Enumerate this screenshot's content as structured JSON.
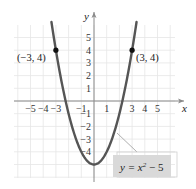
{
  "chart_data": {
    "type": "line",
    "title": "",
    "xlabel": "x",
    "ylabel": "y",
    "xlim": [
      -6,
      6
    ],
    "ylim": [
      -6,
      6
    ],
    "grid": true,
    "x_ticks": [
      -5,
      -4,
      -3,
      -1,
      1,
      3,
      4,
      5
    ],
    "y_ticks": [
      5,
      4,
      3,
      2,
      1,
      -1,
      -2,
      -3,
      -4
    ],
    "series": [
      {
        "name": "y = x^2 - 5",
        "equation": "y = x² − 5",
        "x": [
          -3.3,
          -3,
          -2,
          -1,
          0,
          1,
          2,
          3,
          3.3
        ],
        "y": [
          5.89,
          4,
          -1,
          -4,
          -5,
          -4,
          -1,
          4,
          5.89
        ]
      }
    ],
    "points": [
      {
        "x": -3,
        "y": 4,
        "label": "(−3, 4)"
      },
      {
        "x": 3,
        "y": 4,
        "label": "(3, 4)"
      }
    ],
    "annotations": [
      {
        "text": "y = x² − 5",
        "type": "callout-box"
      }
    ]
  },
  "labels": {
    "x_axis": "x",
    "y_axis": "y",
    "point_left": "(−3, 4)",
    "point_right": "(3, 4)",
    "equation": "y = x",
    "equation_exp": "2",
    "equation_tail": " − 5"
  },
  "colors": {
    "curve": "#555555",
    "grid": "#e6e6e6",
    "axis": "#8a8a8a",
    "label_box": "#d9d9d9",
    "point": "#111111"
  }
}
